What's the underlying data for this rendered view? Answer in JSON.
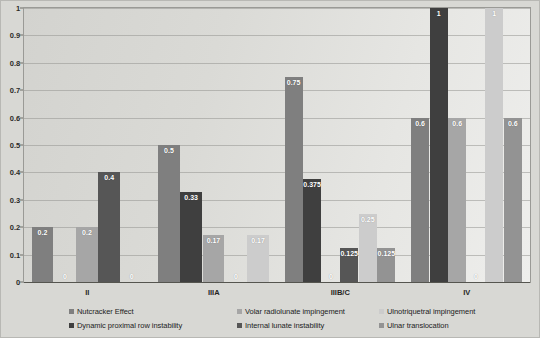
{
  "chart_data": {
    "type": "bar",
    "title": "",
    "subtitle": "",
    "xlabel": "",
    "ylabel": "",
    "categories": [
      "II",
      "IIIA",
      "IIIB/C",
      "IV"
    ],
    "ylim": [
      0,
      1
    ],
    "ytick_labels": [
      "0",
      "0.1",
      "0.2",
      "0.3",
      "0.4",
      "0.5",
      "0.6",
      "0.7",
      "0.8",
      "0.9",
      "1"
    ],
    "ytick_values": [
      0,
      0.1,
      0.2,
      0.3,
      0.4,
      0.5,
      0.6,
      0.7,
      0.8,
      0.9,
      1
    ],
    "grid": true,
    "legend_position": "bottom",
    "series": [
      {
        "name": "Nutcracker Effect",
        "color": "#7f7f7f",
        "values": [
          0.2,
          0.5,
          0.75,
          0.6
        ],
        "labels": [
          "0.2",
          "0.5",
          "0.75",
          "0.6"
        ]
      },
      {
        "name": "Dynamic proximal row instability",
        "color": "#3f3f3f",
        "values": [
          0,
          0.33,
          0.375,
          1
        ],
        "labels": [
          "0",
          "0.33",
          "0.375",
          "1"
        ]
      },
      {
        "name": "Volar radiolunate impingement",
        "color": "#a6a6a6",
        "values": [
          0.2,
          0.17,
          0,
          0.6
        ],
        "labels": [
          "0.2",
          "0.17",
          "0",
          "0.6"
        ]
      },
      {
        "name": "Internal lunate instability",
        "color": "#565656",
        "values": [
          0.4,
          0,
          0.125,
          0
        ],
        "labels": [
          "0.4",
          "0",
          "0.125",
          "0"
        ]
      },
      {
        "name": "Ulnotriquetral impingement",
        "color": "#cccccc",
        "values": [
          0,
          0.17,
          0.25,
          1
        ],
        "labels": [
          "0",
          "0.17",
          "0.25",
          "1"
        ]
      },
      {
        "name": "Ulnar translocation",
        "color": "#939393",
        "values": [
          null,
          null,
          0.125,
          0.6
        ],
        "labels": [
          "",
          "",
          "0.125",
          "0.6"
        ]
      }
    ]
  },
  "legend": {
    "rows": [
      [
        {
          "label": "Nutcracker Effect",
          "color": "#7f7f7f"
        },
        {
          "label": "Volar radiolunate impingement",
          "color": "#a6a6a6"
        },
        {
          "label": "Ulnotriquetral impingement",
          "color": "#cccccc"
        }
      ],
      [
        {
          "label": "Dynamic proximal row instability",
          "color": "#3f3f3f"
        },
        {
          "label": "Internal lunate instability",
          "color": "#565656"
        },
        {
          "label": "Ulnar translocation",
          "color": "#939393"
        }
      ]
    ]
  }
}
